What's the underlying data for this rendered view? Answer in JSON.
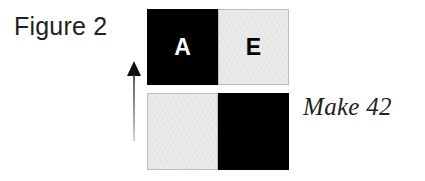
{
  "figure": {
    "caption": "Figure 2",
    "side_note": "Make 42"
  },
  "colors": {
    "background": "#ffffff",
    "dark_fill": "#000000",
    "light_fill": "#ebebeb",
    "light_border": "#bcbcbc",
    "ink": "#231f20"
  },
  "arrow": {
    "name": "upward-arrow",
    "direction": "up"
  },
  "bars": [
    {
      "name": "top-bar",
      "halves": [
        {
          "position": "left",
          "fill": "dark",
          "letter": "A"
        },
        {
          "position": "right",
          "fill": "light",
          "letter": "E"
        }
      ]
    },
    {
      "name": "bottom-bar",
      "halves": [
        {
          "position": "left",
          "fill": "light",
          "letter": ""
        },
        {
          "position": "right",
          "fill": "dark",
          "letter": ""
        }
      ]
    }
  ]
}
